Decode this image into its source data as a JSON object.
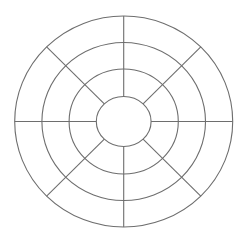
{
  "diagram": {
    "type": "concentric-ring-wheel",
    "canvas": {
      "width": 245,
      "height": 236,
      "background": "#ffffff"
    },
    "center": {
      "x": 123.7,
      "y": 121.5
    },
    "stroke": {
      "color": "#6e6e6e",
      "width": 1.1
    },
    "rings": [
      {
        "rx": 27.4,
        "ry": 25.0
      },
      {
        "rx": 54.6,
        "ry": 52.5
      },
      {
        "rx": 81.8,
        "ry": 79.0
      },
      {
        "rx": 109.0,
        "ry": 105.5
      }
    ],
    "spokes": {
      "count": 8,
      "angles_deg": [
        0,
        45,
        90,
        135,
        180,
        225,
        270,
        315
      ],
      "from_ring": 0,
      "to_ring": 3
    },
    "segments_per_ring": 8,
    "labels": []
  }
}
